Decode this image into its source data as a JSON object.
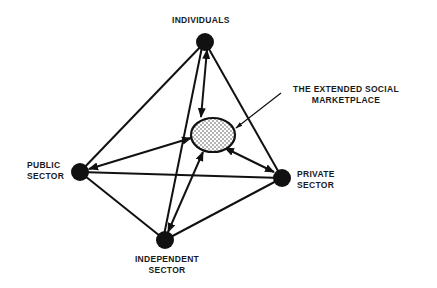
{
  "diagram": {
    "nodes": [
      {
        "id": "individuals",
        "label": "INDIVIDUALS"
      },
      {
        "id": "public",
        "label_line1": "PUBLIC",
        "label_line2": "SECTOR"
      },
      {
        "id": "private",
        "label_line1": "PRIVATE",
        "label_line2": "SECTOR"
      },
      {
        "id": "independent",
        "label_line1": "INDEPENDENT",
        "label_line2": "SECTOR"
      }
    ],
    "center": {
      "label_line1": "THE EXTENDED SOCIAL",
      "label_line2": "MARKETPLACE"
    },
    "edges": [
      {
        "from": "individuals",
        "to": "public",
        "type": "line"
      },
      {
        "from": "individuals",
        "to": "private",
        "type": "line"
      },
      {
        "from": "individuals",
        "to": "independent",
        "type": "line"
      },
      {
        "from": "public",
        "to": "private",
        "type": "line"
      },
      {
        "from": "public",
        "to": "independent",
        "type": "line"
      },
      {
        "from": "independent",
        "to": "private",
        "type": "line"
      },
      {
        "from": "individuals",
        "to": "center",
        "type": "double-arrow"
      },
      {
        "from": "public",
        "to": "center",
        "type": "double-arrow"
      },
      {
        "from": "private",
        "to": "center",
        "type": "double-arrow"
      },
      {
        "from": "independent",
        "to": "center",
        "type": "double-arrow"
      }
    ],
    "colors": {
      "ink": "#111111",
      "fill": "#ffffff"
    }
  }
}
